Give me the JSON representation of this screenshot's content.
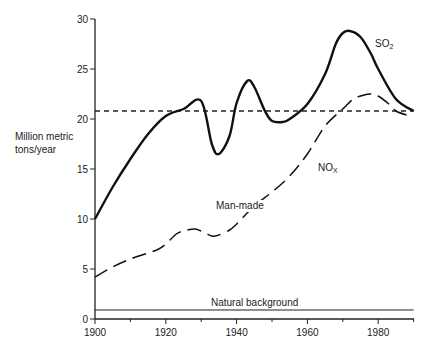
{
  "chart_data": {
    "type": "line",
    "title": "",
    "xlabel": "",
    "ylabel": "Million metric tons/year",
    "ylabel_lines": [
      "Million metric",
      "tons/year"
    ],
    "xlim": [
      1900,
      1990
    ],
    "ylim": [
      0,
      30
    ],
    "x_ticks": [
      1900,
      1910,
      1920,
      1930,
      1940,
      1950,
      1960,
      1970,
      1980,
      1990
    ],
    "x_tick_labels": [
      "1900",
      "1920",
      "1940",
      "1960",
      "1980"
    ],
    "y_ticks": [
      0,
      5,
      10,
      15,
      20,
      25,
      30
    ],
    "y_tick_labels": [
      "0",
      "5",
      "10",
      "15",
      "20",
      "25",
      "30"
    ],
    "grid": false,
    "legend": "inline labels",
    "series": [
      {
        "name": "SO2",
        "label_main": "SO",
        "label_sub": "2",
        "style": "solid-thick",
        "x": [
          1900,
          1905,
          1910,
          1915,
          1920,
          1925,
          1930,
          1933,
          1935,
          1938,
          1940,
          1943,
          1945,
          1948,
          1950,
          1953,
          1955,
          1960,
          1965,
          1968,
          1970,
          1972,
          1975,
          1978,
          1980,
          1985,
          1990
        ],
        "values": [
          10.0,
          13.2,
          16.0,
          18.5,
          20.3,
          21.0,
          21.8,
          17.5,
          16.5,
          18.3,
          21.6,
          23.8,
          23.2,
          20.8,
          19.8,
          19.7,
          20.0,
          21.5,
          24.5,
          27.5,
          28.6,
          28.8,
          28.2,
          26.5,
          25.0,
          22.0,
          20.8
        ]
      },
      {
        "name": "NOx",
        "label_main": "NO",
        "label_sub": "X",
        "style": "long-dash",
        "x": [
          1900,
          1905,
          1910,
          1915,
          1918,
          1920,
          1923,
          1925,
          1928,
          1930,
          1933,
          1935,
          1938,
          1940,
          1945,
          1950,
          1955,
          1960,
          1965,
          1970,
          1973,
          1976,
          1978,
          1980,
          1983,
          1985,
          1988,
          1990
        ],
        "values": [
          4.2,
          5.2,
          6.0,
          6.6,
          7.0,
          7.5,
          8.5,
          8.8,
          9.0,
          8.8,
          8.3,
          8.4,
          8.9,
          9.5,
          11.3,
          12.7,
          14.3,
          16.5,
          19.3,
          21.0,
          22.0,
          22.4,
          22.5,
          22.3,
          21.5,
          20.8,
          20.4,
          20.3
        ]
      },
      {
        "name": "Reference level",
        "style": "short-dash",
        "x": [
          1900,
          1990
        ],
        "values": [
          20.8,
          20.8
        ]
      },
      {
        "name": "Natural background",
        "style": "solid-thin",
        "x": [
          1900,
          1990
        ],
        "values": [
          0.9,
          0.9
        ]
      }
    ],
    "annotations": [
      {
        "text": "Man-made",
        "x": 1933,
        "y": 13.0
      },
      {
        "text": "Natural background",
        "x": 1952,
        "y": 1.0
      },
      {
        "text": "SO2",
        "x": 1982,
        "y": 27.0
      },
      {
        "text": "NOx",
        "x": 1967,
        "y": 15.8
      }
    ]
  },
  "labels": {
    "ylabel_line1": "Million metric",
    "ylabel_line2": "tons/year",
    "man_made": "Man-made",
    "natural_background": "Natural background",
    "so2_main": "SO",
    "so2_sub": "2",
    "nox_main": "NO",
    "nox_sub": "X"
  }
}
